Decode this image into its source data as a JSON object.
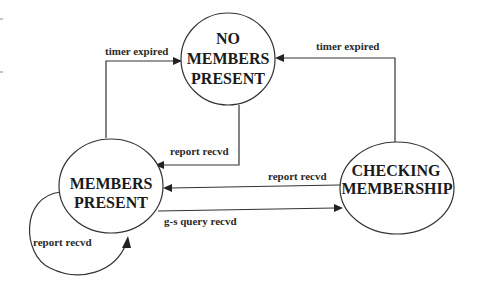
{
  "diagram": {
    "type": "state-transition",
    "colors": {
      "stroke": "#333333",
      "text": "#1a1a1a",
      "background": "#ffffff"
    },
    "states": [
      {
        "id": "no_members",
        "lines": [
          "NO",
          "MEMBERS",
          "PRESENT"
        ]
      },
      {
        "id": "members",
        "lines": [
          "MEMBERS",
          "PRESENT"
        ]
      },
      {
        "id": "checking",
        "lines": [
          "CHECKING",
          "MEMBERSHIP"
        ]
      }
    ],
    "transitions": [
      {
        "from": "members",
        "to": "no_members",
        "label": "timer expired"
      },
      {
        "from": "checking",
        "to": "no_members",
        "label": "timer expired"
      },
      {
        "from": "no_members",
        "to": "members",
        "label": "report recvd"
      },
      {
        "from": "checking",
        "to": "members",
        "label": "report recvd"
      },
      {
        "from": "members",
        "to": "checking",
        "label": "g-s query recvd"
      },
      {
        "from": "members",
        "to": "members",
        "label": "report recvd"
      }
    ]
  }
}
